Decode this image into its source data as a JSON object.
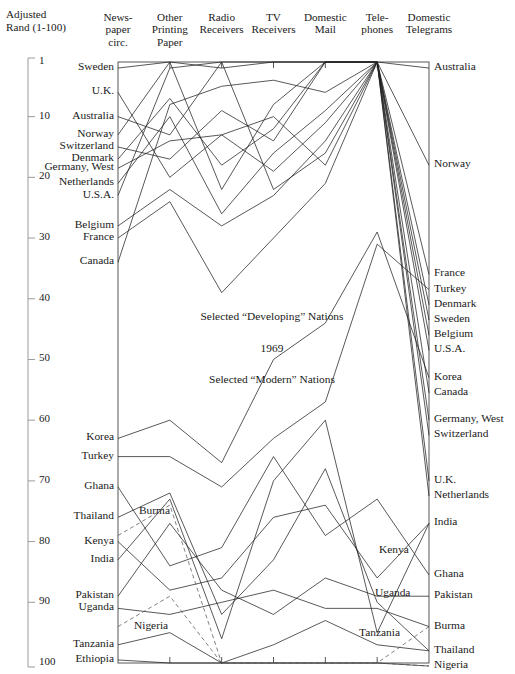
{
  "page": {
    "number": ""
  },
  "axis": {
    "title_line1": "Adjusted",
    "title_line2": "Rand (1-100)",
    "ticks": [
      1,
      10,
      20,
      30,
      40,
      50,
      60,
      70,
      80,
      90,
      100
    ],
    "min": 1,
    "max": 100
  },
  "columns": [
    {
      "id": "newspaper",
      "lines": [
        "News-",
        "paper",
        "circ."
      ]
    },
    {
      "id": "otherpaper",
      "lines": [
        "Other",
        "Printing",
        "Paper"
      ]
    },
    {
      "id": "radio",
      "lines": [
        "Radio",
        "Receivers",
        ""
      ]
    },
    {
      "id": "tv",
      "lines": [
        "TV",
        "Receivers",
        ""
      ]
    },
    {
      "id": "mail",
      "lines": [
        "Domestic",
        "Mail",
        ""
      ]
    },
    {
      "id": "telephone",
      "lines": [
        "Tele-",
        "phones",
        ""
      ]
    },
    {
      "id": "telegram",
      "lines": [
        "Domestic",
        "Telegrams",
        ""
      ]
    }
  ],
  "annotations": [
    {
      "id": "developing",
      "text": "Selected “Developing” Nations",
      "x": 272,
      "y": 318
    },
    {
      "id": "year",
      "text": "1969",
      "x": 272,
      "y": 350
    },
    {
      "id": "modern",
      "text": "Selected “Modern” Nations",
      "x": 272,
      "y": 381
    }
  ],
  "inner_labels": [
    {
      "id": "burma",
      "text": "Burma",
      "x": 138,
      "y": 512
    },
    {
      "id": "kenya",
      "text": "Kenya",
      "x": 378,
      "y": 551
    },
    {
      "id": "uganda",
      "text": "Uganda",
      "x": 374,
      "y": 594
    },
    {
      "id": "nigeria",
      "text": "Nigeria",
      "x": 133,
      "y": 627
    },
    {
      "id": "tanzania",
      "text": "Tanzania",
      "x": 358,
      "y": 634
    }
  ],
  "left_labels": [
    {
      "name": "Sweden",
      "rank": 2
    },
    {
      "name": "U.K.",
      "rank": 6
    },
    {
      "name": "Australia",
      "rank": 10
    },
    {
      "name": "Norway",
      "rank": 13
    },
    {
      "name": "Switzerland",
      "rank": 15
    },
    {
      "name": "Denmark",
      "rank": 17
    },
    {
      "name": "Germany, West",
      "rank": 18.5
    },
    {
      "name": "Netherlands",
      "rank": 21
    },
    {
      "name": "U.S.A.",
      "rank": 23
    },
    {
      "name": "Belgium",
      "rank": 28
    },
    {
      "name": "France",
      "rank": 30
    },
    {
      "name": "Canada",
      "rank": 34
    },
    {
      "name": "Korea",
      "rank": 63
    },
    {
      "name": "Turkey",
      "rank": 66
    },
    {
      "name": "Ghana",
      "rank": 71
    },
    {
      "name": "Thailand",
      "rank": 76
    },
    {
      "name": "Kenya",
      "rank": 80
    },
    {
      "name": "India",
      "rank": 83
    },
    {
      "name": "Pakistan",
      "rank": 89
    },
    {
      "name": "Uganda",
      "rank": 91
    },
    {
      "name": "Tanzania",
      "rank": 97
    },
    {
      "name": "Ethiopia",
      "rank": 99.5
    }
  ],
  "right_labels": [
    {
      "name": "Australia",
      "rank": 2
    },
    {
      "name": "Norway",
      "rank": 18
    },
    {
      "name": "France",
      "rank": 36
    },
    {
      "name": "Turkey",
      "rank": 38.5
    },
    {
      "name": "Denmark",
      "rank": 41
    },
    {
      "name": "Sweden",
      "rank": 43.5
    },
    {
      "name": "Belgium",
      "rank": 46
    },
    {
      "name": "U.S.A.",
      "rank": 48.5
    },
    {
      "name": "Korea",
      "rank": 53
    },
    {
      "name": "Canada",
      "rank": 55.5
    },
    {
      "name": "Germany, West",
      "rank": 60
    },
    {
      "name": "Switzerland",
      "rank": 62.5
    },
    {
      "name": "U.K.",
      "rank": 70
    },
    {
      "name": "Netherlands",
      "rank": 72.5
    },
    {
      "name": "India",
      "rank": 77
    },
    {
      "name": "Ghana",
      "rank": 85.5
    },
    {
      "name": "Pakistan",
      "rank": 89
    },
    {
      "name": "Burma",
      "rank": 94
    },
    {
      "name": "Thailand",
      "rank": 98
    },
    {
      "name": "Nigeria",
      "rank": 100.5
    }
  ],
  "chart_data": {
    "type": "line",
    "subtype": "parallel-coordinates",
    "title": "1969",
    "xlabel": "",
    "ylabel": "Adjusted Rand (1-100)",
    "ylim": [
      1,
      100
    ],
    "y_inverted": true,
    "grid": false,
    "legend": "none",
    "axes": [
      "Newspaper circ.",
      "Other Printing Paper",
      "Radio Receivers",
      "TV Receivers",
      "Domestic Mail",
      "Telephones",
      "Domestic Telegrams"
    ],
    "series": [
      {
        "name": "Sweden",
        "group": "modern",
        "values": [
          2,
          1,
          2,
          1,
          1,
          1,
          43.5
        ]
      },
      {
        "name": "U.K.",
        "group": "modern",
        "values": [
          6,
          20,
          13,
          10,
          18,
          1,
          70
        ]
      },
      {
        "name": "Australia",
        "group": "modern",
        "values": [
          10,
          13,
          1,
          22,
          16,
          1,
          2
        ]
      },
      {
        "name": "Norway",
        "group": "modern",
        "values": [
          13,
          1,
          22,
          8,
          1,
          1,
          18
        ]
      },
      {
        "name": "Switzerland",
        "group": "modern",
        "values": [
          15,
          17,
          9,
          14,
          1,
          1,
          62.5
        ]
      },
      {
        "name": "Denmark",
        "group": "modern",
        "values": [
          17,
          7,
          18,
          12,
          1,
          1,
          41
        ]
      },
      {
        "name": "Germany, West",
        "group": "modern",
        "values": [
          18.5,
          14,
          13,
          19,
          11,
          1,
          60
        ]
      },
      {
        "name": "Netherlands",
        "group": "modern",
        "values": [
          21,
          10,
          26,
          16,
          9,
          1,
          72.5
        ]
      },
      {
        "name": "U.S.A.",
        "group": "modern",
        "values": [
          23,
          2,
          1,
          1,
          1,
          1,
          48.5
        ]
      },
      {
        "name": "Belgium",
        "group": "modern",
        "values": [
          28,
          22,
          28,
          23,
          14,
          1,
          46
        ]
      },
      {
        "name": "France",
        "group": "modern",
        "values": [
          30,
          24,
          39,
          30,
          21,
          1,
          36
        ]
      },
      {
        "name": "Canada",
        "group": "modern",
        "values": [
          34,
          8,
          5,
          4,
          6,
          1,
          55.5
        ]
      },
      {
        "name": "Korea",
        "group": "developing",
        "values": [
          63,
          60,
          67,
          50,
          44,
          29,
          53
        ]
      },
      {
        "name": "Turkey",
        "group": "developing",
        "values": [
          66,
          66,
          71,
          63,
          57,
          31,
          38.5
        ]
      },
      {
        "name": "Ghana",
        "group": "developing",
        "values": [
          71,
          84,
          81,
          66,
          79,
          73,
          85.5
        ]
      },
      {
        "name": "Thailand",
        "group": "developing",
        "values": [
          76,
          72,
          92,
          83,
          68,
          90,
          98
        ]
      },
      {
        "name": "Kenya",
        "group": "developing",
        "values": [
          80,
          88,
          86,
          76,
          74,
          86,
          77
        ]
      },
      {
        "name": "India",
        "group": "developing",
        "values": [
          83,
          73,
          96,
          70,
          60,
          95,
          77
        ]
      },
      {
        "name": "Pakistan",
        "group": "developing",
        "values": [
          89,
          77,
          88,
          92,
          86,
          89,
          89
        ]
      },
      {
        "name": "Uganda",
        "group": "developing",
        "values": [
          91,
          92,
          90,
          88,
          91,
          91,
          94
        ]
      },
      {
        "name": "Tanzania",
        "group": "developing",
        "values": [
          97,
          95,
          100,
          97,
          93,
          97,
          98
        ]
      },
      {
        "name": "Ethiopia",
        "group": "developing",
        "values": [
          99.5,
          100,
          100,
          100,
          100,
          100,
          100.5
        ]
      },
      {
        "name": "Burma",
        "group": "developing",
        "values": [
          79,
          74,
          100,
          100,
          100,
          100,
          94
        ],
        "dashed": true
      },
      {
        "name": "Nigeria",
        "group": "developing",
        "values": [
          94,
          89,
          100,
          100,
          100,
          100,
          100.5
        ],
        "dashed": true
      }
    ]
  }
}
